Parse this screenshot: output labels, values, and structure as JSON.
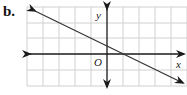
{
  "figure": {
    "part_label": "b.",
    "x_axis_label": "x",
    "y_axis_label": "y",
    "origin_label": "O"
  },
  "grid": {
    "cell_px": 16,
    "x_range": [
      -5,
      5
    ],
    "y_range": [
      -2,
      3
    ],
    "grid_color": "#d0d0d0",
    "axis_color": "#1a1a1a",
    "line_color": "#333333"
  },
  "line": {
    "description": "straight line with negative slope, arrows at both ends",
    "slope": -0.5,
    "y_intercept": 0.5,
    "x_intercept": 1,
    "start": [
      -4.5,
      2.75
    ],
    "end": [
      4.75,
      -1.8
    ]
  }
}
